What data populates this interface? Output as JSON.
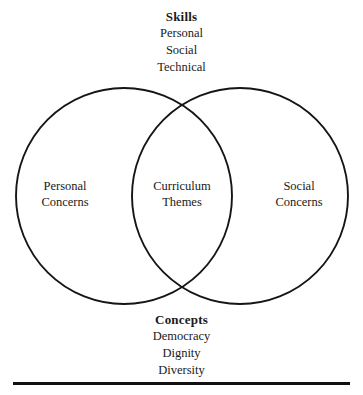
{
  "diagram": {
    "type": "venn",
    "title_top": "Skills",
    "title_bottom": "Concepts",
    "stroke_color": "#151515",
    "background_color": "#ffffff",
    "text_color": "#1a1a1a"
  },
  "top_block": {
    "heading": "Skills",
    "items": [
      "Personal",
      "Social",
      "Technical"
    ]
  },
  "bottom_block": {
    "heading": "Concepts",
    "items": [
      "Democracy",
      "Dignity",
      "Diversity"
    ]
  },
  "regions": {
    "left": {
      "line1": "Personal",
      "line2": "Concerns"
    },
    "center": {
      "line1": "Curriculum",
      "line2": "Themes"
    },
    "right": {
      "line1": "Social",
      "line2": "Concerns"
    }
  },
  "geometry": {
    "left_circle": {
      "cx": 124,
      "cy": 196,
      "r": 108
    },
    "right_circle": {
      "cx": 240,
      "cy": 196,
      "r": 108
    },
    "rule": {
      "x": 13,
      "y": 382,
      "width": 337,
      "height": 3
    }
  }
}
